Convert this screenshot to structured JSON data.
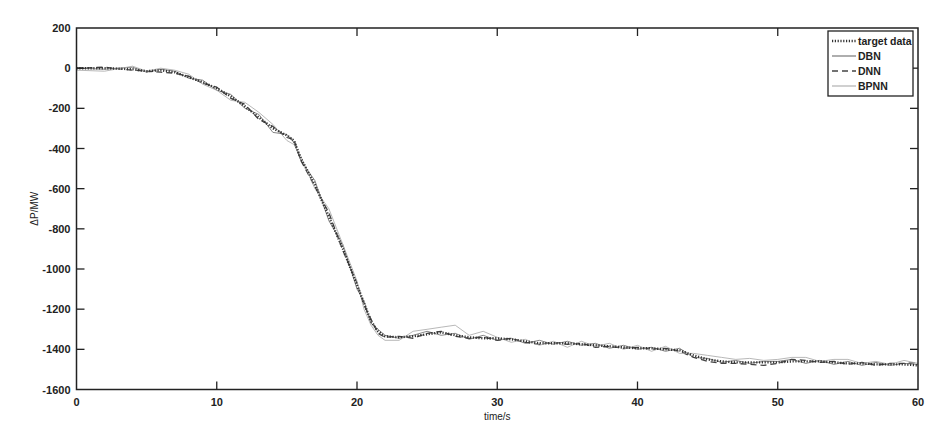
{
  "chart_data": {
    "type": "line",
    "title": "",
    "xlabel": "time/s",
    "ylabel": "ΔP/MW",
    "xlim": [
      0,
      60
    ],
    "ylim": [
      -1600,
      200
    ],
    "xticks": [
      0,
      10,
      20,
      30,
      40,
      50,
      60
    ],
    "yticks": [
      200,
      0,
      -200,
      -400,
      -600,
      -800,
      -1000,
      -1200,
      -1400,
      -1600
    ],
    "grid": false,
    "legend_position": "upper right",
    "series": [
      {
        "name": "target data",
        "style": "dotted",
        "color": "#333333",
        "width": 2.4,
        "x": [
          0,
          2,
          4,
          5,
          6,
          7,
          8,
          9,
          10,
          11,
          12,
          13,
          14,
          15,
          15.5,
          16,
          17,
          18,
          19,
          20,
          20.5,
          21,
          21.5,
          22,
          23,
          24,
          25,
          26,
          27,
          28,
          29,
          30,
          31,
          32,
          33,
          34,
          35,
          36,
          37,
          38,
          39,
          40,
          41,
          42,
          43,
          44,
          45,
          46,
          47,
          48,
          49,
          50,
          51,
          52,
          53,
          54,
          55,
          56,
          57,
          58,
          59,
          60
        ],
        "y": [
          0,
          0,
          -5,
          -15,
          -10,
          -20,
          -45,
          -70,
          -100,
          -140,
          -190,
          -245,
          -300,
          -335,
          -360,
          -450,
          -580,
          -740,
          -900,
          -1080,
          -1170,
          -1260,
          -1310,
          -1335,
          -1340,
          -1335,
          -1325,
          -1315,
          -1330,
          -1340,
          -1345,
          -1345,
          -1350,
          -1360,
          -1370,
          -1370,
          -1370,
          -1375,
          -1380,
          -1385,
          -1390,
          -1395,
          -1395,
          -1400,
          -1405,
          -1430,
          -1450,
          -1460,
          -1465,
          -1465,
          -1465,
          -1465,
          -1460,
          -1460,
          -1460,
          -1465,
          -1470,
          -1470,
          -1475,
          -1475,
          -1475,
          -1480
        ]
      },
      {
        "name": "DBN",
        "style": "solid",
        "color": "#777777",
        "width": 0.9,
        "x": [
          0,
          2,
          4,
          5,
          6,
          7,
          8,
          9,
          10,
          11,
          12,
          13,
          14,
          15,
          15.5,
          16,
          17,
          18,
          19,
          20,
          20.5,
          21,
          21.5,
          22,
          23,
          24,
          25,
          26,
          27,
          28,
          29,
          30,
          31,
          32,
          33,
          34,
          35,
          36,
          37,
          38,
          39,
          40,
          41,
          42,
          43,
          44,
          45,
          46,
          47,
          48,
          49,
          50,
          51,
          52,
          53,
          54,
          55,
          56,
          57,
          58,
          59,
          60
        ],
        "y": [
          0,
          -5,
          5,
          -20,
          -5,
          -15,
          -50,
          -60,
          -110,
          -130,
          -200,
          -230,
          -320,
          -330,
          -370,
          -460,
          -560,
          -760,
          -880,
          -1100,
          -1160,
          -1270,
          -1300,
          -1330,
          -1345,
          -1330,
          -1310,
          -1330,
          -1320,
          -1350,
          -1330,
          -1355,
          -1345,
          -1370,
          -1355,
          -1375,
          -1360,
          -1380,
          -1370,
          -1395,
          -1380,
          -1400,
          -1390,
          -1410,
          -1395,
          -1440,
          -1445,
          -1465,
          -1455,
          -1470,
          -1460,
          -1460,
          -1450,
          -1470,
          -1455,
          -1475,
          -1460,
          -1480,
          -1465,
          -1480,
          -1470,
          -1475
        ]
      },
      {
        "name": "DNN",
        "style": "dashed",
        "color": "#444444",
        "width": 1.3,
        "x": [
          0,
          2,
          4,
          5,
          6,
          7,
          8,
          9,
          10,
          11,
          12,
          13,
          14,
          15,
          15.5,
          16,
          17,
          18,
          19,
          20,
          20.5,
          21,
          21.5,
          22,
          23,
          24,
          25,
          26,
          27,
          28,
          29,
          30,
          31,
          32,
          33,
          34,
          35,
          36,
          37,
          38,
          39,
          40,
          41,
          42,
          43,
          44,
          45,
          46,
          47,
          48,
          49,
          50,
          51,
          52,
          53,
          54,
          55,
          56,
          57,
          58,
          59,
          60
        ],
        "y": [
          0,
          5,
          -10,
          -15,
          -20,
          -25,
          -40,
          -75,
          -95,
          -150,
          -180,
          -255,
          -290,
          -345,
          -355,
          -460,
          -590,
          -720,
          -910,
          -1070,
          -1180,
          -1250,
          -1320,
          -1340,
          -1335,
          -1345,
          -1320,
          -1310,
          -1335,
          -1345,
          -1340,
          -1355,
          -1345,
          -1365,
          -1375,
          -1365,
          -1375,
          -1370,
          -1390,
          -1385,
          -1395,
          -1390,
          -1400,
          -1395,
          -1410,
          -1440,
          -1460,
          -1470,
          -1470,
          -1475,
          -1480,
          -1470,
          -1450,
          -1455,
          -1465,
          -1460,
          -1475,
          -1465,
          -1480,
          -1470,
          -1470,
          -1465
        ]
      },
      {
        "name": "BPNN",
        "style": "solid",
        "color": "#b0b0b0",
        "width": 0.9,
        "x": [
          0,
          2,
          4,
          5,
          6,
          7,
          8,
          9,
          10,
          11,
          12,
          13,
          14,
          15,
          15.5,
          16,
          17,
          18,
          19,
          20,
          20.5,
          21,
          21.5,
          22,
          23,
          24,
          25,
          26,
          27,
          28,
          29,
          30,
          31,
          32,
          33,
          34,
          35,
          36,
          37,
          38,
          39,
          40,
          41,
          42,
          43,
          44,
          45,
          46,
          47,
          48,
          49,
          50,
          51,
          52,
          53,
          54,
          55,
          56,
          57,
          58,
          59,
          60
        ],
        "y": [
          -10,
          -15,
          10,
          -15,
          0,
          -10,
          -30,
          -80,
          -110,
          -160,
          -170,
          -220,
          -280,
          -360,
          -380,
          -440,
          -600,
          -700,
          -880,
          -1060,
          -1200,
          -1280,
          -1330,
          -1355,
          -1355,
          -1310,
          -1300,
          -1290,
          -1280,
          -1330,
          -1310,
          -1340,
          -1365,
          -1350,
          -1380,
          -1360,
          -1390,
          -1360,
          -1385,
          -1370,
          -1400,
          -1380,
          -1410,
          -1385,
          -1420,
          -1420,
          -1430,
          -1440,
          -1450,
          -1445,
          -1455,
          -1450,
          -1440,
          -1440,
          -1460,
          -1450,
          -1450,
          -1470,
          -1460,
          -1475,
          -1455,
          -1470
        ]
      }
    ]
  }
}
